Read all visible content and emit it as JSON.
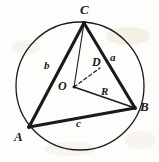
{
  "figure": {
    "background_color": "#fdfdfb",
    "ink_color": "#1a1a1a",
    "smudge_color": "#e8e0cf",
    "canvas": {
      "width": 159,
      "height": 162
    },
    "circle": {
      "cx": 80,
      "cy": 86,
      "r": 64,
      "stroke_width": 1.3
    },
    "points": {
      "A": {
        "x": 29,
        "y": 127
      },
      "B": {
        "x": 135,
        "y": 108
      },
      "C": {
        "x": 84,
        "y": 23
      },
      "O": {
        "x": 74,
        "y": 87
      },
      "D": {
        "x": 100,
        "y": 68
      }
    },
    "edges": [
      {
        "name": "side-b-CA",
        "from": "C",
        "to": "A",
        "style": "thick"
      },
      {
        "name": "side-a-CB",
        "from": "C",
        "to": "B",
        "style": "thick"
      },
      {
        "name": "side-c-AB",
        "from": "A",
        "to": "B",
        "style": "thick"
      },
      {
        "name": "segment-CO",
        "from": "C",
        "to": "O",
        "style": "thin"
      },
      {
        "name": "radius-OB",
        "from": "O",
        "to": "B",
        "style": "thin"
      },
      {
        "name": "segment-OD",
        "from": "O",
        "to": "D",
        "style": "dashed"
      }
    ],
    "labels": {
      "A": {
        "text": "A",
        "x": 14,
        "y": 130,
        "kind": "vertex"
      },
      "B": {
        "text": "B",
        "x": 140,
        "y": 100,
        "kind": "vertex"
      },
      "C": {
        "text": "C",
        "x": 80,
        "y": 3,
        "kind": "vertex"
      },
      "O": {
        "text": "O",
        "x": 58,
        "y": 80,
        "kind": "point"
      },
      "D": {
        "text": "D",
        "x": 92,
        "y": 56,
        "kind": "point"
      },
      "a": {
        "text": "a",
        "x": 110,
        "y": 52,
        "kind": "side"
      },
      "b": {
        "text": "b",
        "x": 44,
        "y": 60,
        "kind": "side"
      },
      "c": {
        "text": "c",
        "x": 76,
        "y": 118,
        "kind": "side"
      },
      "R": {
        "text": "R",
        "x": 101,
        "y": 86,
        "kind": "side"
      }
    }
  }
}
